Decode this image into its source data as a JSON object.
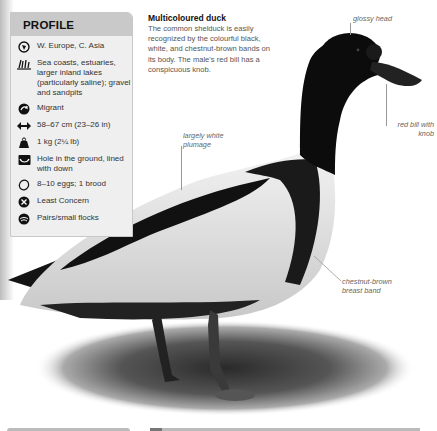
{
  "profile": {
    "title": "PROFILE",
    "items": [
      {
        "icon": "globe-icon",
        "text": "W. Europe, C. Asia"
      },
      {
        "icon": "reeds-habitat-icon",
        "text": "Sea coasts, estuaries, larger inland lakes (particularly saline); gravel and sandpits"
      },
      {
        "icon": "migration-arrow-icon",
        "text": "Migrant"
      },
      {
        "icon": "length-arrows-icon",
        "text": "58–67 cm (23–26 in)"
      },
      {
        "icon": "weight-icon",
        "text": "1 kg (2¼ lb)"
      },
      {
        "icon": "nest-icon",
        "text": "Hole in the ground, lined with down"
      },
      {
        "icon": "egg-icon",
        "text": "8–10 eggs; 1 brood"
      },
      {
        "icon": "conservation-status-icon",
        "text": "Least Concern"
      },
      {
        "icon": "social-flock-icon",
        "text": "Pairs/small flocks"
      }
    ]
  },
  "intro": {
    "title": "Multicoloured duck",
    "body": "The common shelduck is easily recognized by the colourful black, white, and chestnut-brown bands on its body. The male's red bill has a conspicuous knob."
  },
  "callouts": {
    "glossy_head": "glossy head",
    "red_bill": "red bill with knob",
    "white_plumage": "largely white plumage",
    "breast_band": "chestnut-brown breast band"
  },
  "colors": {
    "panel_bg": "#efefef",
    "panel_header": "#c9c9c9",
    "text": "#333333",
    "callout": "#666666"
  }
}
